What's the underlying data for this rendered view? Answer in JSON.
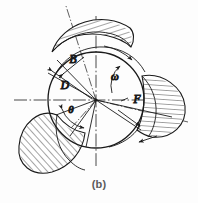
{
  "figure": {
    "caption": "(b)",
    "background_color": "#fdfdfd",
    "line_color": "#1a1a1a",
    "type": "engineering-diagram",
    "center": {
      "x": 96,
      "y": 100
    },
    "hub_radius": 48,
    "blade_count": 3,
    "labels": {
      "blade_width": "B",
      "diameter": "D",
      "blade_angle": "θ",
      "angular_velocity": "ω",
      "pitch": "F"
    },
    "label_positions": {
      "blade_width": {
        "x": 73,
        "y": 63
      },
      "diameter": {
        "x": 65,
        "y": 89
      },
      "blade_angle": {
        "x": 71,
        "y": 113
      },
      "angular_velocity": {
        "x": 115,
        "y": 80
      },
      "pitch": {
        "x": 137,
        "y": 103
      }
    },
    "centerlines": {
      "horizontal": {
        "x1": 14,
        "y1": 100,
        "x2": 176,
        "y2": 100
      },
      "vertical": {
        "x1": 96,
        "y1": 16,
        "x2": 96,
        "y2": 166
      }
    },
    "blade_axes_degrees": [
      108,
      228,
      348
    ]
  }
}
